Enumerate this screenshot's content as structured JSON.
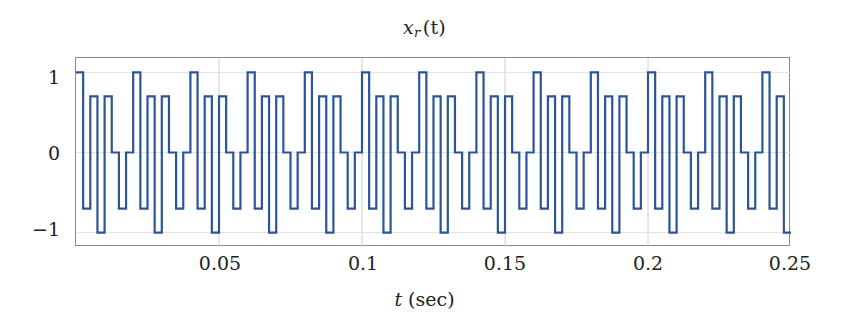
{
  "chart_data": {
    "type": "line",
    "title_base": "x",
    "title_sub": "r",
    "title_arg": "(t)",
    "xlabel": "t (sec)",
    "xlabel_var": "t",
    "xlabel_unit": "(sec)",
    "ylabel": "",
    "xlim": [
      0,
      0.25
    ],
    "ylim": [
      -1.18,
      1.18
    ],
    "grid": true,
    "legend": null,
    "line_color": "#2b5597",
    "line_width": 2.2,
    "drawstyle": "steps-post",
    "sample_period": 0.0025,
    "signal_period": 0.02,
    "levels": [
      1,
      0.7,
      0,
      -0.7,
      -1
    ],
    "xticks": [
      0.05,
      0.1,
      0.15,
      0.2,
      0.25
    ],
    "xtick_labels": [
      "0.05",
      "0.1",
      "0.15",
      "0.2",
      "0.25"
    ],
    "yticks": [
      1,
      0,
      -1
    ],
    "ytick_labels": [
      "1",
      "0",
      "−1"
    ],
    "pattern_one_period": [
      1,
      -0.7,
      0.7,
      -1,
      0.7,
      0,
      -0.7,
      0
    ],
    "values": [
      1,
      -0.7,
      0.7,
      -1,
      0.7,
      0,
      -0.7,
      0,
      1,
      -0.7,
      0.7,
      -1,
      0.7,
      0,
      -0.7,
      0,
      1,
      -0.7,
      0.7,
      -1,
      0.7,
      0,
      -0.7,
      0,
      1,
      -0.7,
      0.7,
      -1,
      0.7,
      0,
      -0.7,
      0,
      1,
      -0.7,
      0.7,
      -1,
      0.7,
      0,
      -0.7,
      0,
      1,
      -0.7,
      0.7,
      -1,
      0.7,
      0,
      -0.7,
      0,
      1,
      -0.7,
      0.7,
      -1,
      0.7,
      0,
      -0.7,
      0,
      1,
      -0.7,
      0.7,
      -1,
      0.7,
      0,
      -0.7,
      0,
      1,
      -0.7,
      0.7,
      -1,
      0.7,
      0,
      -0.7,
      0,
      1,
      -0.7,
      0.7,
      -1,
      0.7,
      0,
      -0.7,
      0,
      1,
      -0.7,
      0.7,
      -1,
      0.7,
      0,
      -0.7,
      0,
      1,
      -0.7,
      0.7,
      -1,
      0.7,
      0,
      -0.7,
      0,
      1,
      -0.7,
      0.7,
      -1
    ],
    "x": [
      0,
      0.0025,
      0.005,
      0.0075,
      0.01,
      0.0125,
      0.015,
      0.0175,
      0.02,
      0.0225,
      0.025,
      0.0275,
      0.03,
      0.0325,
      0.035,
      0.0375,
      0.04,
      0.0425,
      0.045,
      0.0475,
      0.05,
      0.0525,
      0.055,
      0.0575,
      0.06,
      0.0625,
      0.065,
      0.0675,
      0.07,
      0.0725,
      0.075,
      0.0775,
      0.08,
      0.0825,
      0.085,
      0.0875,
      0.09,
      0.0925,
      0.095,
      0.0975,
      0.1,
      0.1025,
      0.105,
      0.1075,
      0.11,
      0.1125,
      0.115,
      0.1175,
      0.12,
      0.1225,
      0.125,
      0.1275,
      0.13,
      0.1325,
      0.135,
      0.1375,
      0.14,
      0.1425,
      0.145,
      0.1475,
      0.15,
      0.1525,
      0.155,
      0.1575,
      0.16,
      0.1625,
      0.165,
      0.1675,
      0.17,
      0.1725,
      0.175,
      0.1775,
      0.18,
      0.1825,
      0.185,
      0.1875,
      0.19,
      0.1925,
      0.195,
      0.1975,
      0.2,
      0.2025,
      0.205,
      0.2075,
      0.21,
      0.2125,
      0.215,
      0.2175,
      0.22,
      0.2225,
      0.225,
      0.2275,
      0.23,
      0.2325,
      0.235,
      0.2375,
      0.24,
      0.2425,
      0.245,
      0.2475
    ]
  }
}
